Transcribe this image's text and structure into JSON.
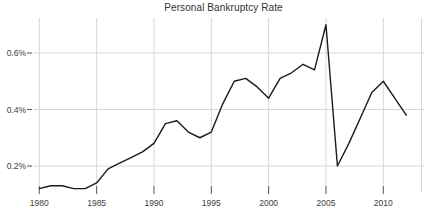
{
  "title": "Personal Bankruptcy Rate",
  "colors": {
    "background": "#ffffff",
    "line": "#1a1a1a",
    "grid": "#d8d8d8",
    "panel_border": "#d8d8d8",
    "tick": "#555555",
    "tick_label": "#404040",
    "title_text": "#333333"
  },
  "chart_data": {
    "type": "line",
    "title": "Personal Bankruptcy Rate",
    "xlabel": "",
    "ylabel": "",
    "x": [
      1980,
      1981,
      1982,
      1983,
      1984,
      1985,
      1986,
      1987,
      1988,
      1989,
      1990,
      1991,
      1992,
      1993,
      1994,
      1995,
      1996,
      1997,
      1998,
      1999,
      2000,
      2001,
      2002,
      2003,
      2004,
      2005,
      2006,
      2007,
      2008,
      2009,
      2010,
      2011,
      2012
    ],
    "values": [
      0.12,
      0.13,
      0.13,
      0.12,
      0.12,
      0.14,
      0.19,
      0.21,
      0.23,
      0.25,
      0.28,
      0.35,
      0.36,
      0.32,
      0.3,
      0.32,
      0.42,
      0.5,
      0.51,
      0.48,
      0.44,
      0.51,
      0.53,
      0.56,
      0.54,
      0.7,
      0.2,
      0.28,
      0.37,
      0.46,
      0.5,
      0.44,
      0.38
    ],
    "x_tick_labels": [
      "1980",
      "1985",
      "1990",
      "1995",
      "2000",
      "2005",
      "2010"
    ],
    "x_tick_values": [
      1980,
      1985,
      1990,
      1995,
      2000,
      2005,
      2010
    ],
    "y_tick_labels": [
      "0.2%",
      "0.4%",
      "0.6%"
    ],
    "y_tick_values": [
      0.2,
      0.4,
      0.6
    ],
    "xlim": [
      1979.3,
      2013.4
    ],
    "ylim": [
      0.1,
      0.72
    ],
    "grid": true,
    "legend": "none"
  }
}
